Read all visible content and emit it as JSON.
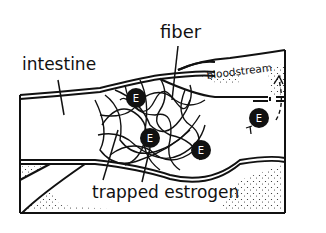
{
  "diagram": {
    "labels": {
      "intestine": "intestine",
      "fiber": "fiber",
      "bloodstream": "bloodstream",
      "trapped_estrogen": "trapped estrogen"
    },
    "molecule_letter": "E",
    "colors": {
      "ink": "#111111",
      "background": "#ffffff"
    }
  }
}
